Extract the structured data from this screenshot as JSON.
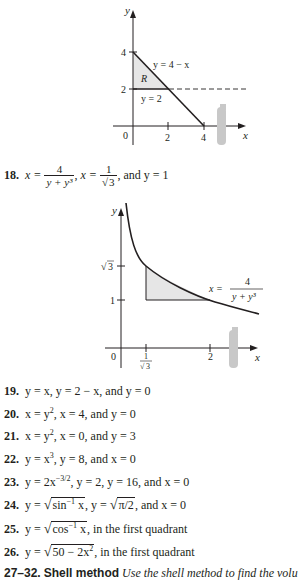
{
  "figure1": {
    "axis_x_label": "x",
    "axis_y_label": "y",
    "origin_label": "0",
    "x_ticks": [
      "2",
      "4"
    ],
    "y_ticks": [
      "4",
      "2"
    ],
    "region_label": "R",
    "line1_label": "y = 4 − x",
    "line2_label": "y = 2",
    "fill_color": "#e6e6e6",
    "axis_of_revolution": "y = 2 (dashed)"
  },
  "problem18": {
    "number": "18.",
    "eq1_lhs": "x =",
    "eq1_num": "4",
    "eq1_den": "y + y³",
    "eq2_lhs": "x =",
    "eq2_num": "1",
    "eq2_den": "3",
    "tail": ", and y = 1"
  },
  "figure2": {
    "axis_x_label": "x",
    "axis_y_label": "y",
    "origin_label": "0",
    "x_ticks": [
      "1/√3",
      "2"
    ],
    "x_tick_num": "1",
    "x_tick_den": "3",
    "x_tick_2": "2",
    "y_ticks": [
      "√3",
      "1"
    ],
    "y_tick_sqrt3": "3",
    "y_tick_1": "1",
    "curve_label_lhs": "x =",
    "curve_label_num": "4",
    "curve_label_den": "y + y³",
    "fill_color": "#e6e6e6"
  },
  "problems": [
    {
      "number": "19.",
      "text": "y = x, y = 2 − x, and y = 0"
    },
    {
      "number": "20.",
      "text": "x = y², x = 4, and y = 0"
    },
    {
      "number": "21.",
      "text": "x = y², x = 0, and y = 3"
    },
    {
      "number": "22.",
      "text": "y = x³, y = 8, and x = 0"
    },
    {
      "number": "23.",
      "text": "y = 2x^(−3/2), y = 2, y = 16, and x = 0"
    },
    {
      "number": "24.",
      "text": "y = √(sin⁻¹ x), y = √(π/2), and x = 0"
    },
    {
      "number": "25.",
      "text": "y = √(cos⁻¹ x), in the first quadrant"
    },
    {
      "number": "26.",
      "text": "y = √(50 − 2x²), in the first quadrant"
    }
  ],
  "problem_parts": {
    "p19": {
      "a": "y = x, y = 2 − x, and y = 0"
    },
    "p20": {
      "a": "x = y",
      "b": "2",
      "c": ", x = 4, and y = 0"
    },
    "p21": {
      "a": "x = y",
      "b": "2",
      "c": ", x = 0, and y = 3"
    },
    "p22": {
      "a": "y = x",
      "b": "3",
      "c": ", y = 8, and x = 0"
    },
    "p23": {
      "a": "y = 2x",
      "b": "−3/2",
      "c": ", y = 2, y = 16, and x = 0"
    },
    "p24": {
      "a": "y = ",
      "rad1": "sin",
      "sup1": "−1",
      "rad1b": " x",
      "b": ", y = ",
      "rad2": "π/2",
      "c": ", and x = 0"
    },
    "p25": {
      "a": "y = ",
      "rad": "cos",
      "sup": "−1",
      "radb": " x",
      "c": ", in the first quadrant"
    },
    "p26": {
      "a": "y = ",
      "rad": "50 − 2x",
      "sup": "2",
      "c": ", in the first quadrant"
    }
  },
  "section_heading": {
    "range": "27–32.",
    "title": "Shell method",
    "instruction": "Use the shell method to find the volu"
  }
}
